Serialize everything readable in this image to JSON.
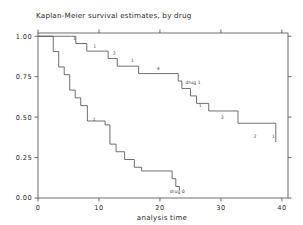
{
  "chart_data": {
    "type": "line",
    "title": "Kaplan-Meier survival estimates, by drug",
    "xlabel": "analysis time",
    "ylabel": "",
    "xlim": [
      0,
      41
    ],
    "ylim": [
      0,
      1.02
    ],
    "grid": false,
    "legend_position": "inline-annotations",
    "xticks": [
      0,
      10,
      20,
      30,
      40
    ],
    "xticklabels": [
      "0",
      "10",
      "20",
      "30",
      "40"
    ],
    "yticks": [
      0.0,
      0.25,
      0.5,
      0.75,
      1.0
    ],
    "yticklabels": [
      "0.00",
      "0.25",
      "0.50",
      "0.75",
      "1.00"
    ],
    "series": [
      {
        "name": "drug 1",
        "label": "drug 1",
        "label_x": 24.2,
        "label_y": 0.705,
        "step": "post",
        "x": [
          0,
          1.5,
          5.5,
          6.2,
          8.0,
          10.5,
          11.5,
          13.0,
          15.5,
          16.5,
          22.0,
          23.0,
          23.6,
          24.2,
          25.0,
          26.0,
          28.0,
          32.8,
          39.0
        ],
        "y": [
          1.0,
          1.0,
          1.0,
          0.955,
          0.908,
          0.908,
          0.862,
          0.815,
          0.815,
          0.769,
          0.769,
          0.723,
          0.677,
          0.677,
          0.631,
          0.585,
          0.538,
          0.462,
          0.345
        ]
      },
      {
        "name": "drug 0",
        "label": "drug 0",
        "label_x": 21.6,
        "label_y": 0.028,
        "step": "post",
        "x": [
          0,
          1.2,
          2.5,
          3.4,
          4.3,
          5.2,
          6.1,
          7.0,
          8.1,
          11.0,
          11.8,
          12.8,
          14.2,
          15.8,
          17.0,
          22.0,
          22.6,
          23.2
        ],
        "y": [
          1.0,
          1.0,
          0.905,
          0.81,
          0.762,
          0.667,
          0.619,
          0.571,
          0.476,
          0.452,
          0.333,
          0.286,
          0.238,
          0.19,
          0.167,
          0.119,
          0.071,
          0.048
        ]
      }
    ],
    "annotations": [
      {
        "text": "1",
        "x": 6.0,
        "y": 0.975
      },
      {
        "text": "1",
        "x": 9.3,
        "y": 0.93
      },
      {
        "text": "2",
        "x": 12.5,
        "y": 0.884
      },
      {
        "text": "1",
        "x": 15.5,
        "y": 0.838
      },
      {
        "text": "4",
        "x": 19.7,
        "y": 0.793
      },
      {
        "text": "1",
        "x": 26.6,
        "y": 0.562
      },
      {
        "text": "3",
        "x": 30.2,
        "y": 0.487
      },
      {
        "text": "2",
        "x": 35.6,
        "y": 0.37
      },
      {
        "text": "1",
        "x": 38.6,
        "y": 0.37
      },
      {
        "text": "1",
        "x": 9.2,
        "y": 0.478
      }
    ]
  }
}
